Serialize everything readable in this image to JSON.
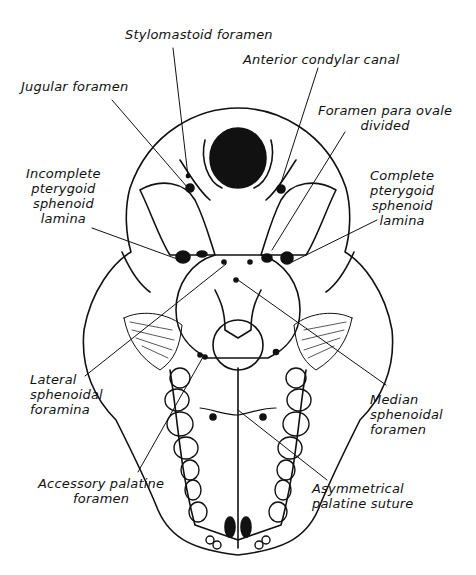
{
  "figure": {
    "labels": {
      "stylomastoid": [
        "Stylomastoid foramen"
      ],
      "anterior_condylar": [
        "Anterior condylar canal"
      ],
      "jugular": [
        "Jugular foramen"
      ],
      "foramen_para_ovale": [
        "Foramen para ovale",
        "divided"
      ],
      "incomplete_pterygoid": [
        "Incomplete",
        "pterygoid",
        "sphenoid",
        "lamina"
      ],
      "complete_pterygoid": [
        "Complete",
        "pterygoid",
        "sphenoid",
        "lamina"
      ],
      "lateral_sphenoidal": [
        "Lateral",
        "sphenoidal",
        "foramina"
      ],
      "median_sphenoidal": [
        "Median",
        "sphenoidal",
        "foramen"
      ],
      "accessory_palatine": [
        "Accessory palatine",
        "foramen"
      ],
      "asymmetrical_palatine": [
        "Asymmetrical",
        "palatine suture"
      ]
    },
    "colors": {
      "ink": "#111111",
      "paper": "#ffffff"
    }
  }
}
